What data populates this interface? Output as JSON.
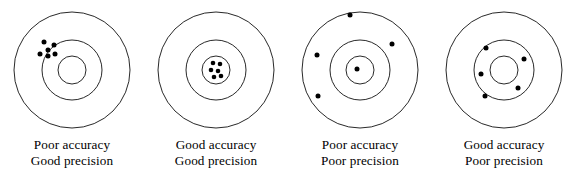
{
  "figure": {
    "background_color": "#ffffff",
    "stroke_color": "#111111",
    "dot_color": "#000000",
    "panel_width": 144,
    "panel_height": 191
  },
  "chart_data": {
    "type": "scatter",
    "xlabel": "",
    "ylabel": "",
    "xlim": [
      -60,
      60
    ],
    "ylim": [
      -60,
      60
    ],
    "grid": false,
    "legend": "none",
    "annotations": [
      "Poor accuracy",
      "Good precision",
      "Good accuracy",
      "Good precision",
      "Poor accuracy",
      "Poor precision",
      "Good accuracy",
      "Poor precision"
    ],
    "target_rings": {
      "outer_radius": 58,
      "middle_radius": 30,
      "inner_radius": 14
    },
    "series": [
      {
        "name": "Poor accuracy, Good precision",
        "center": [
          72,
          70
        ],
        "points": [
          [
            -28,
            28
          ],
          [
            -18,
            25
          ],
          [
            -24,
            20
          ],
          [
            -32,
            16
          ],
          [
            -24,
            14
          ],
          [
            -17,
            16
          ]
        ]
      },
      {
        "name": "Good accuracy, Good precision",
        "center": [
          72,
          70
        ],
        "points": [
          [
            -3,
            7
          ],
          [
            4,
            6
          ],
          [
            -5,
            0
          ],
          [
            2,
            -1
          ],
          [
            5,
            -6
          ],
          [
            -2,
            -7
          ]
        ]
      },
      {
        "name": "Poor accuracy, Poor precision",
        "center": [
          72,
          70
        ],
        "points": [
          [
            -10,
            55
          ],
          [
            32,
            26
          ],
          [
            -43,
            15
          ],
          [
            -3,
            1
          ],
          [
            -42,
            -26
          ]
        ]
      },
      {
        "name": "Good accuracy, Poor precision",
        "center": [
          72,
          70
        ],
        "points": [
          [
            -18,
            22
          ],
          [
            20,
            11
          ],
          [
            -23,
            -4
          ],
          [
            14,
            -18
          ],
          [
            -19,
            -26
          ]
        ]
      }
    ]
  },
  "panels": [
    {
      "id": "panel-poor-accuracy-good-precision",
      "left": 0,
      "caption_line1": "Poor accuracy",
      "caption_line2": "Good precision",
      "rings": [
        58,
        30,
        14
      ],
      "dots": [
        {
          "x": -28,
          "y": 28,
          "r": 2.5
        },
        {
          "x": -18,
          "y": 25,
          "r": 2.5
        },
        {
          "x": -24,
          "y": 20,
          "r": 2.5
        },
        {
          "x": -32,
          "y": 16,
          "r": 2.5
        },
        {
          "x": -24,
          "y": 14,
          "r": 2.5
        },
        {
          "x": -17,
          "y": 16,
          "r": 2.5
        }
      ]
    },
    {
      "id": "panel-good-accuracy-good-precision",
      "left": 144,
      "caption_line1": "Good accuracy",
      "caption_line2": "Good precision",
      "rings": [
        58,
        30,
        14
      ],
      "dots": [
        {
          "x": -3,
          "y": 7,
          "r": 2.3
        },
        {
          "x": 4,
          "y": 6,
          "r": 2.3
        },
        {
          "x": -5,
          "y": 0,
          "r": 2.3
        },
        {
          "x": 2,
          "y": -1,
          "r": 2.3
        },
        {
          "x": 5,
          "y": -6,
          "r": 2.3
        },
        {
          "x": -2,
          "y": -7,
          "r": 2.3
        }
      ]
    },
    {
      "id": "panel-poor-accuracy-poor-precision",
      "left": 288,
      "caption_line1": "Poor accuracy",
      "caption_line2": "Poor precision",
      "rings": [
        58,
        30,
        14
      ],
      "dots": [
        {
          "x": -10,
          "y": 55,
          "r": 2.5
        },
        {
          "x": 32,
          "y": 26,
          "r": 2.5
        },
        {
          "x": -43,
          "y": 15,
          "r": 2.5
        },
        {
          "x": -3,
          "y": 1,
          "r": 2.5
        },
        {
          "x": -42,
          "y": -26,
          "r": 2.5
        }
      ]
    },
    {
      "id": "panel-good-accuracy-poor-precision",
      "left": 432,
      "caption_line1": "Good accuracy",
      "caption_line2": "Poor precision",
      "rings": [
        58,
        30,
        14
      ],
      "dots": [
        {
          "x": -18,
          "y": 22,
          "r": 2.5
        },
        {
          "x": 20,
          "y": 11,
          "r": 2.5
        },
        {
          "x": -23,
          "y": -4,
          "r": 2.5
        },
        {
          "x": 14,
          "y": -18,
          "r": 2.5
        },
        {
          "x": -19,
          "y": -26,
          "r": 2.5
        }
      ]
    }
  ]
}
